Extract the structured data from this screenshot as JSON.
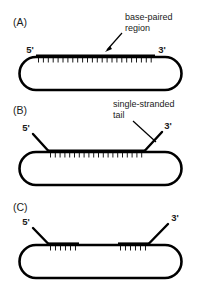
{
  "figure": {
    "background_color": "#ffffff",
    "stroke_color": "#000000",
    "width": 203,
    "height": 283
  },
  "panels": [
    {
      "id": "A",
      "letter": "(A)",
      "five_prime_label": "5'",
      "three_prime_label": "3'",
      "callout": "base-paired region",
      "callout_line1": "base-paired",
      "callout_line2": "region",
      "base_pair_rungs": 24,
      "has_single_stranded_tails": false,
      "description": "Fully base-paired region spanning the top of the circular molecule"
    },
    {
      "id": "B",
      "letter": "(B)",
      "five_prime_label": "5'",
      "three_prime_label": "3'",
      "callout": "single-stranded tail",
      "callout_line1": "single-stranded",
      "callout_line2": "tail",
      "base_pair_rungs": 20,
      "has_single_stranded_tails": true,
      "description": "Base-paired region with single-stranded tails at both ends"
    },
    {
      "id": "C",
      "letter": "(C)",
      "five_prime_label": "5'",
      "three_prime_label": "3'",
      "callout": "",
      "callout_line1": "",
      "callout_line2": "",
      "base_pair_rungs_left": 6,
      "base_pair_rungs_right": 6,
      "has_single_stranded_tails": true,
      "description": "Two short base-paired segments separated by an unpaired gap, with single-stranded tails"
    }
  ]
}
